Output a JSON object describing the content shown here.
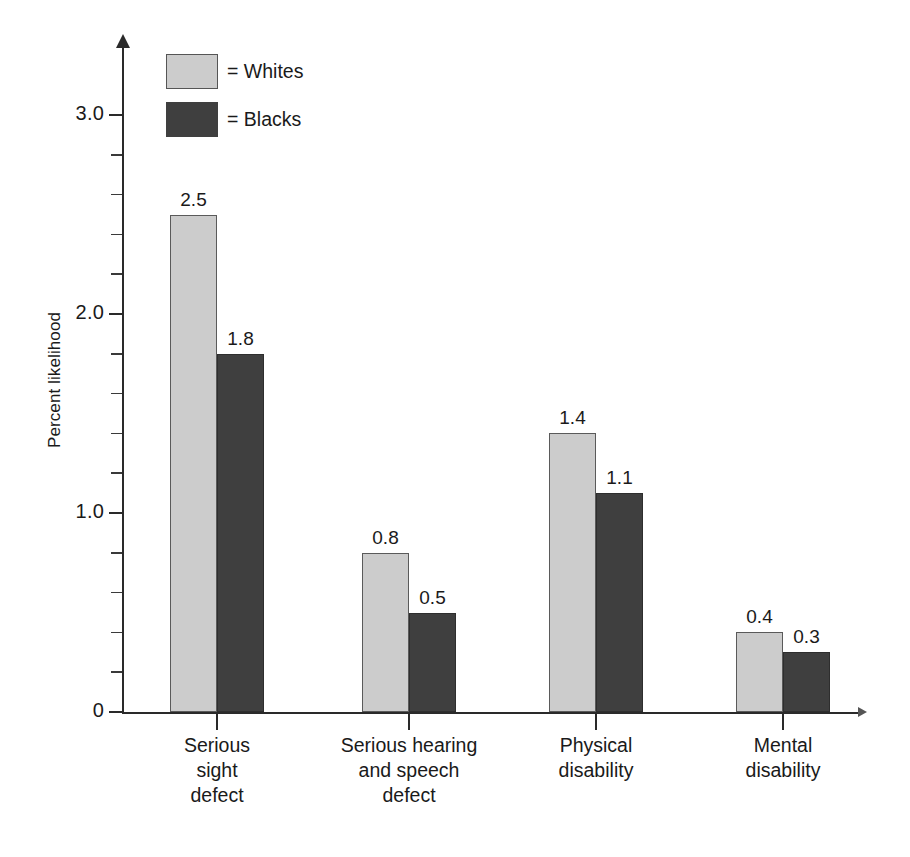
{
  "top_fragment": "",
  "chart_data": {
    "type": "bar",
    "title": "",
    "xlabel": "",
    "ylabel": "Percent likelihood",
    "ylim": [
      0,
      3.2
    ],
    "grid": false,
    "legend_position": "top-left",
    "categories": [
      "Serious\nsight\ndefect",
      "Serious hearing\nand speech\ndefect",
      "Physical\ndisability",
      "Mental\ndisability"
    ],
    "category_lines": [
      [
        "Serious",
        "sight",
        "defect"
      ],
      [
        "Serious hearing",
        "and speech",
        "defect"
      ],
      [
        "Physical",
        "disability"
      ],
      [
        "Mental",
        "disability"
      ]
    ],
    "series": [
      {
        "name": "Whites",
        "legend_label": "= Whites",
        "color": "#cccccc",
        "values": [
          2.5,
          0.8,
          1.4,
          0.4
        ],
        "value_labels": [
          "2.5",
          "0.8",
          "1.4",
          "0.4"
        ]
      },
      {
        "name": "Blacks",
        "legend_label": "= Blacks",
        "color": "#3f3f3f",
        "values": [
          1.8,
          0.5,
          1.1,
          0.3
        ],
        "value_labels": [
          "1.8",
          "0.5",
          "1.1",
          "0.3"
        ]
      }
    ],
    "y_ticks_major": [
      {
        "value": 0,
        "label": "0"
      },
      {
        "value": 1.0,
        "label": "1.0"
      },
      {
        "value": 2.0,
        "label": "2.0"
      },
      {
        "value": 3.0,
        "label": "3.0"
      }
    ],
    "y_ticks_minor": [
      0.2,
      0.4,
      0.6,
      0.8,
      1.2,
      1.4,
      1.6,
      1.8,
      2.2,
      2.4,
      2.6,
      2.8,
      3.0
    ],
    "y_minor_step": 0.2,
    "axis_color": "#2a2a2a"
  }
}
